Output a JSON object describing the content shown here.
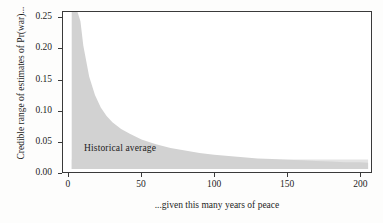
{
  "chart_data": {
    "type": "area",
    "title": "",
    "xlabel": "...given this many years of peace",
    "ylabel": "Credible range of estimates of Pr(war)...",
    "xlim": [
      -4,
      208
    ],
    "ylim": [
      0,
      0.26
    ],
    "xticks": [
      0,
      50,
      100,
      150,
      200
    ],
    "xtick_labels": [
      "0",
      "50",
      "100",
      "150",
      "200"
    ],
    "yticks": [
      0.0,
      0.05,
      0.1,
      0.15,
      0.2,
      0.25
    ],
    "ytick_labels": [
      "0.00",
      "0.05",
      "0.10",
      "0.15",
      "0.20",
      "0.25"
    ],
    "grid": false,
    "legend": null,
    "annotations": [
      {
        "text": "Historical average",
        "x": 8,
        "y": 0.026
      }
    ],
    "series": [
      {
        "name": "Credible range of Pr(war)",
        "fill_color": "#d2d2d2",
        "x": [
          2,
          4,
          6,
          8,
          10,
          14,
          18,
          22,
          26,
          30,
          36,
          42,
          50,
          60,
          70,
          80,
          90,
          100,
          110,
          120,
          130,
          140,
          150,
          160,
          170,
          180,
          190,
          200,
          206
        ],
        "y_upper": [
          0.26,
          0.26,
          0.26,
          0.245,
          0.205,
          0.155,
          0.125,
          0.105,
          0.091,
          0.081,
          0.07,
          0.062,
          0.053,
          0.045,
          0.039,
          0.035,
          0.031,
          0.028,
          0.026,
          0.024,
          0.022,
          0.021,
          0.02,
          0.019,
          0.018,
          0.017,
          0.016,
          0.016,
          0.015
        ],
        "y_lower": [
          0.005,
          0.005,
          0.005,
          0.005,
          0.005,
          0.005,
          0.005,
          0.005,
          0.005,
          0.005,
          0.005,
          0.005,
          0.005,
          0.005,
          0.005,
          0.005,
          0.005,
          0.005,
          0.005,
          0.005,
          0.005,
          0.005,
          0.005,
          0.005,
          0.005,
          0.005,
          0.005,
          0.005,
          0.005
        ]
      },
      {
        "name": "Historical average band",
        "fill_color": "#e3e3e3",
        "x": [
          2,
          206
        ],
        "y_upper": [
          0.0205,
          0.0205
        ],
        "y_lower": [
          0.005,
          0.005
        ]
      }
    ]
  },
  "colors": {
    "page_background": "#fdfdfc",
    "plot_background": "#ffffff",
    "axis": "#3a3a3a",
    "text": "#1d1d1d",
    "band_dark": "#d2d2d2",
    "band_light": "#e3e3e3"
  }
}
